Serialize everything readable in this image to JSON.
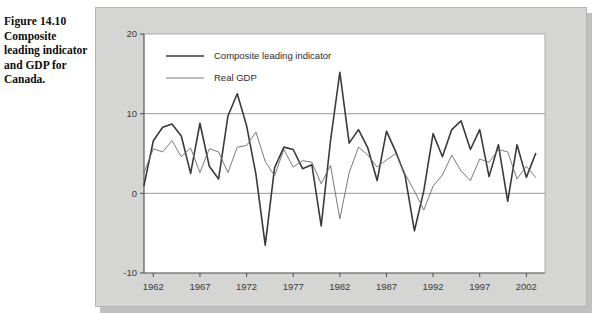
{
  "caption": {
    "figure_number": "Figure 14.10",
    "title": "Composite leading indicator and GDP for Canada."
  },
  "legend": {
    "position": "top-left-inside",
    "items": [
      {
        "label": "Composite leading indicator",
        "color": "#3a3a3a",
        "width": 1.6
      },
      {
        "label": "Real GDP",
        "color": "#6b6b6b",
        "width": 0.9
      }
    ]
  },
  "chart_data": {
    "type": "line",
    "title": "",
    "subtitle": "",
    "xlabel": "",
    "ylabel": "",
    "xlim": [
      1961,
      2004
    ],
    "ylim": [
      -10,
      20
    ],
    "yticks": [
      -10,
      0,
      10,
      20
    ],
    "ytick_labels": [
      "-10",
      "0",
      "10",
      "20"
    ],
    "xticks": [
      1962,
      1967,
      1972,
      1977,
      1982,
      1987,
      1992,
      1997,
      2002
    ],
    "xtick_labels": [
      "1962",
      "1967",
      "1972",
      "1977",
      "1982",
      "1987",
      "1992",
      "1997",
      "2002"
    ],
    "grid": "horizontal-at-0-and-10",
    "gridlines_y": [
      0,
      10
    ],
    "background": "#ffffff",
    "frame": true,
    "series": [
      {
        "name": "Composite leading indicator",
        "color": "#3a3a3a",
        "width": 1.6,
        "x": [
          1961,
          1962,
          1963,
          1964,
          1965,
          1966,
          1967,
          1968,
          1969,
          1970,
          1971,
          1972,
          1973,
          1974,
          1975,
          1976,
          1977,
          1978,
          1979,
          1980,
          1981,
          1982,
          1983,
          1984,
          1985,
          1986,
          1987,
          1988,
          1989,
          1990,
          1991,
          1992,
          1993,
          1994,
          1995,
          1996,
          1997,
          1998,
          1999,
          2000,
          2001,
          2002,
          2003
        ],
        "y": [
          1.0,
          6.6,
          8.3,
          8.7,
          7.2,
          2.5,
          8.8,
          3.4,
          1.8,
          9.7,
          12.5,
          8.5,
          2.4,
          -6.5,
          3.2,
          5.8,
          5.5,
          3.1,
          3.6,
          -4.1,
          6.6,
          15.2,
          6.3,
          8.0,
          5.7,
          1.6,
          7.8,
          5.2,
          2.2,
          -4.7,
          0.3,
          7.5,
          4.6,
          8.0,
          9.1,
          5.5,
          8.0,
          2.1,
          6.1,
          -1.0,
          6.1,
          2.0,
          5.0
        ]
      },
      {
        "name": "Real GDP",
        "color": "#6b6b6b",
        "width": 0.9,
        "x": [
          1961,
          1962,
          1963,
          1964,
          1965,
          1966,
          1967,
          1968,
          1969,
          1970,
          1971,
          1972,
          1973,
          1974,
          1975,
          1976,
          1977,
          1978,
          1979,
          1980,
          1981,
          1982,
          1983,
          1984,
          1985,
          1986,
          1987,
          1988,
          1989,
          1990,
          1991,
          1992,
          1993,
          1994,
          1995,
          1996,
          1997,
          1998,
          1999,
          2000,
          2001,
          2002,
          2003
        ],
        "y": [
          2.6,
          5.6,
          5.2,
          6.6,
          4.6,
          5.7,
          2.6,
          5.6,
          5.2,
          2.6,
          5.8,
          6.0,
          7.7,
          4.0,
          2.2,
          5.5,
          3.3,
          4.1,
          3.9,
          1.2,
          3.5,
          -3.2,
          2.6,
          5.8,
          4.8,
          3.3,
          4.2,
          5.0,
          2.4,
          0.3,
          -2.1,
          0.9,
          2.3,
          4.8,
          2.8,
          1.6,
          4.3,
          3.9,
          5.5,
          5.2,
          1.8,
          3.4,
          2.0
        ]
      }
    ]
  }
}
